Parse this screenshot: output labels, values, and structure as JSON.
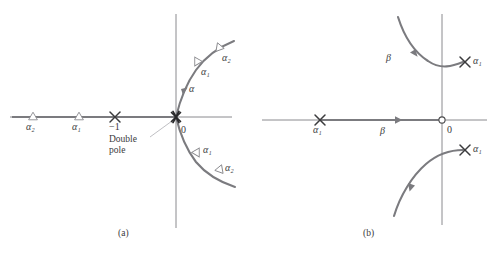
{
  "figure": {
    "background": "#ffffff",
    "line_color": "#7b7b7f",
    "axis_color": "#808084",
    "text_color": "#231f20",
    "leader_color": "#b9b9bd",
    "panels": [
      {
        "id": "a",
        "caption": "(a)",
        "caption_pos": {
          "x": 125,
          "y": 234
        },
        "origin": {
          "x": 176,
          "y": 117
        },
        "axes": {
          "horizontal": {
            "x1": 10,
            "y1": 117,
            "x2": 232,
            "y2": 117
          },
          "vertical": {
            "x1": 176,
            "y1": 14,
            "x2": 176,
            "y2": 228
          }
        },
        "real_axis_locus": {
          "x1": 12,
          "y1": 117,
          "x2": 176,
          "y2": 117
        },
        "markers": [
          {
            "type": "triangle",
            "name": "alpha-2-left",
            "label": "α₂",
            "x": 33,
            "y": 117,
            "label_x": 33,
            "label_y": 131
          },
          {
            "type": "triangle",
            "name": "alpha-1-left",
            "label": "α₁",
            "x": 79,
            "y": 117,
            "label_x": 79,
            "label_y": 131
          },
          {
            "type": "cross",
            "name": "pole-minus-one",
            "label": "−1",
            "x": 115,
            "y": 117,
            "label_x": 115,
            "label_y": 131
          },
          {
            "type": "double-cross",
            "name": "double-pole-origin",
            "label": "0",
            "x": 176,
            "y": 117,
            "label_x": 185,
            "label_y": 133
          },
          {
            "type": "triangle",
            "name": "alpha-1-upper",
            "label": "α₁",
            "x": 197,
            "y": 61,
            "label_x": 206,
            "label_y": 74
          },
          {
            "type": "triangle",
            "name": "alpha-2-upper",
            "label": "α₂",
            "x": 219,
            "y": 47,
            "label_x": 227,
            "label_y": 61
          },
          {
            "type": "triangle",
            "name": "alpha-1-lower",
            "label": "α₁",
            "x": 197,
            "y": 152,
            "label_x": 206,
            "label_y": 152
          },
          {
            "type": "triangle",
            "name": "alpha-2-lower",
            "label": "α₂",
            "x": 220,
            "y": 169,
            "label_x": 228,
            "label_y": 171
          }
        ],
        "branch_labels": [
          {
            "name": "alpha-branch-label",
            "label": "α",
            "x": 193,
            "y": 88
          }
        ],
        "annotation": {
          "name": "double-pole-annotation",
          "line1": "Double",
          "line2": "pole",
          "x": 125,
          "y": 141,
          "leader": {
            "x1": 172,
            "y1": 121,
            "x2": 150,
            "y2": 137
          }
        }
      },
      {
        "id": "b",
        "caption": "(b)",
        "caption_pos": {
          "x": 370,
          "y": 234
        },
        "origin": {
          "x": 442,
          "y": 120
        },
        "axes": {
          "horizontal": {
            "x1": 262,
            "y1": 120,
            "x2": 487,
            "y2": 120
          },
          "vertical": {
            "x1": 442,
            "y1": 14,
            "x2": 442,
            "y2": 225
          }
        },
        "real_axis_locus": {
          "x1": 320,
          "y1": 120,
          "x2": 442,
          "y2": 120
        },
        "markers": [
          {
            "type": "cross",
            "name": "alpha-1-real",
            "label": "α₁",
            "x": 320,
            "y": 120,
            "label_x": 320,
            "label_y": 134
          },
          {
            "type": "circle",
            "name": "zero-origin",
            "label": "0",
            "x": 442,
            "y": 120,
            "label_x": 450,
            "label_y": 134
          },
          {
            "type": "cross",
            "name": "alpha-1-upper-right",
            "label": "α₁",
            "x": 465,
            "y": 62,
            "label_x": 478,
            "label_y": 63
          },
          {
            "type": "cross",
            "name": "alpha-1-lower-right",
            "label": "α₁",
            "x": 465,
            "y": 150,
            "label_x": 478,
            "label_y": 150
          }
        ],
        "branch_labels": [
          {
            "name": "beta-real-label",
            "label": "β",
            "x": 384,
            "y": 136
          },
          {
            "name": "beta-upper-label",
            "label": "β",
            "x": 390,
            "y": 60
          }
        ]
      }
    ]
  }
}
